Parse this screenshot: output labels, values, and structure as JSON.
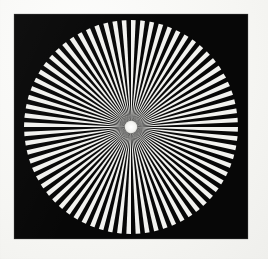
{
  "image": {
    "kind": "radial-starburst-test-pattern",
    "alt_title": "Siemens star radial resolution test chart",
    "width_px": 268,
    "height_px": 259
  },
  "page": {
    "background_color": "#f8f8f6",
    "grain_opacity": 0.5
  },
  "plate": {
    "name": "black square plate",
    "fill_color": "#070707",
    "left_px": 14,
    "top_px": 14,
    "width_px": 234,
    "height_px": 225
  },
  "chart_data": {
    "type": "pie",
    "title": "Radial starburst (Siemens star) test pattern",
    "subtitle": "",
    "xlabel": "",
    "ylabel": "",
    "legend_position": "none",
    "grid": false,
    "center_x_px": 131,
    "center_y_px": 128,
    "outer_radius_px": 108,
    "hub_radius_px": 6,
    "hub_color": "#f2f2ef",
    "spoke_color": "#f2f2ef",
    "gap_color": "#070707",
    "spoke_count": 72,
    "sector_count": 144,
    "sector_angle_deg": 2.5,
    "duty_cycle": 0.5,
    "start_angle_deg": 0,
    "categories": [
      "white spoke",
      "black gap"
    ],
    "values": [
      50,
      50
    ],
    "ylim": [
      0,
      100
    ]
  }
}
